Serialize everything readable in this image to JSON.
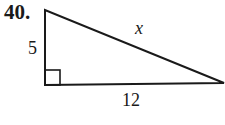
{
  "problem": {
    "number": "40.",
    "figure": "right-triangle",
    "labels": {
      "left_leg": "5",
      "bottom_leg": "12",
      "hypotenuse": "x"
    },
    "right_angle_marker": true
  },
  "colors": {
    "stroke": "#1a1a1a",
    "background": "#ffffff"
  }
}
